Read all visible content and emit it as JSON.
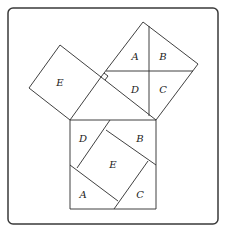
{
  "diagram": {
    "frame": {
      "x": 8,
      "y": 8,
      "w": 210,
      "h": 216,
      "r": 5
    },
    "triangle": {
      "right_angle_vertex": [
        101,
        77
      ],
      "vertices": [
        [
          101,
          77
        ],
        [
          70,
          120
        ],
        [
          156,
          120
        ]
      ]
    },
    "small_square": {
      "points": [
        [
          60,
          45
        ],
        [
          101,
          77
        ],
        [
          70,
          120
        ],
        [
          29,
          88
        ]
      ],
      "label": "E",
      "label_pos": [
        60,
        86
      ]
    },
    "large_leg_square": {
      "points": [
        [
          143,
          22
        ],
        [
          198,
          64
        ],
        [
          156,
          120
        ],
        [
          101,
          77
        ]
      ],
      "cuts": [
        {
          "from": [
            149,
            26
          ],
          "to": [
            149,
            116
          ]
        },
        {
          "from": [
            106,
            71
          ],
          "to": [
            193,
            71
          ]
        }
      ],
      "pieces": [
        {
          "label": "A",
          "pos": [
            135,
            60
          ]
        },
        {
          "label": "B",
          "pos": [
            163,
            60
          ]
        },
        {
          "label": "D",
          "pos": [
            135,
            93
          ]
        },
        {
          "label": "C",
          "pos": [
            163,
            93
          ]
        }
      ]
    },
    "hypotenuse_square": {
      "x": 70,
      "y": 120,
      "w": 86,
      "h": 89,
      "cuts": [
        {
          "from": [
            110,
            120
          ],
          "to": [
            77,
            168
          ]
        },
        {
          "from": [
            106,
            130
          ],
          "to": [
            156,
            165
          ]
        },
        {
          "from": [
            70,
            165
          ],
          "to": [
            118,
            201
          ]
        },
        {
          "from": [
            148,
            161
          ],
          "to": [
            114,
            209
          ]
        }
      ],
      "pieces": [
        {
          "label": "D",
          "pos": [
            83,
            142
          ]
        },
        {
          "label": "B",
          "pos": [
            140,
            142
          ]
        },
        {
          "label": "E",
          "pos": [
            113,
            168
          ]
        },
        {
          "label": "A",
          "pos": [
            83,
            198
          ]
        },
        {
          "label": "C",
          "pos": [
            140,
            198
          ]
        }
      ]
    }
  }
}
